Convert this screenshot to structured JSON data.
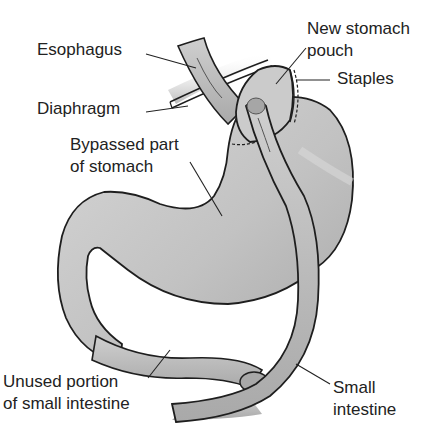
{
  "diagram": {
    "colors": {
      "organ_fill": "#bdbdbd",
      "organ_light": "#d9d9d9",
      "organ_dark": "#9a9a9a",
      "outline": "#1e1e1e",
      "label_text": "#222222",
      "background": "#ffffff"
    },
    "labels": {
      "esophagus": "Esophagus",
      "diaphragm": "Diaphragm",
      "bypassed_line1": "Bypassed part",
      "bypassed_line2": "of stomach",
      "new_pouch_line1": "New stomach",
      "new_pouch_line2": "pouch",
      "staples": "Staples",
      "unused_line1": "Unused portion",
      "unused_line2": "of small intestine",
      "small_intestine_line1": "Small",
      "small_intestine_line2": "intestine"
    }
  }
}
